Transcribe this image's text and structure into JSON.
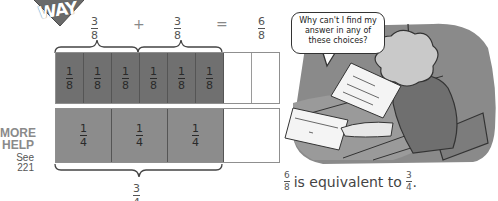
{
  "logo": {
    "text": "WAY",
    "color": "#6a6a6a"
  },
  "equation": {
    "left": {
      "numerator": "3",
      "denominator": "8"
    },
    "plus": "+",
    "right": {
      "numerator": "3",
      "denominator": "8"
    },
    "equals": "=",
    "result": {
      "numerator": "6",
      "denominator": "8"
    }
  },
  "eighths_bar": {
    "cells": [
      {
        "numerator": "1",
        "denominator": "8",
        "filled": true
      },
      {
        "numerator": "1",
        "denominator": "8",
        "filled": true
      },
      {
        "numerator": "1",
        "denominator": "8",
        "filled": true
      },
      {
        "numerator": "1",
        "denominator": "8",
        "filled": true
      },
      {
        "numerator": "1",
        "denominator": "8",
        "filled": true
      },
      {
        "numerator": "1",
        "denominator": "8",
        "filled": true
      },
      {
        "numerator": "",
        "denominator": "",
        "filled": false
      },
      {
        "numerator": "",
        "denominator": "",
        "filled": false
      }
    ],
    "fill_color": "#707070"
  },
  "quarters_bar": {
    "cells": [
      {
        "numerator": "1",
        "denominator": "4",
        "filled": true
      },
      {
        "numerator": "1",
        "denominator": "4",
        "filled": true
      },
      {
        "numerator": "1",
        "denominator": "4",
        "filled": true
      },
      {
        "numerator": "",
        "denominator": "",
        "filled": false
      }
    ],
    "fill_color": "#8c8c8c"
  },
  "bottom_label": {
    "numerator": "3",
    "denominator": "4"
  },
  "more_help": {
    "line1": "MORE",
    "line2": "HELP",
    "see": "See 221"
  },
  "cartoon": {
    "speech": [
      "Why can't I find my",
      "answer in any of",
      "these choices?"
    ]
  },
  "caption": {
    "left": {
      "numerator": "6",
      "denominator": "8"
    },
    "text": "is equivalent to",
    "right": {
      "numerator": "3",
      "denominator": "4"
    },
    "end": "."
  }
}
